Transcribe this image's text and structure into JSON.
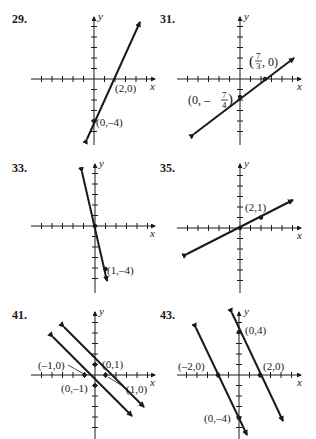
{
  "figure": {
    "panels": [
      {
        "number": "29.",
        "lines": [
          {
            "points": [
              [
                2,
                0
              ],
              [
                0,
                -4
              ]
            ],
            "labels": [
              "(2,0)",
              "(0,–4)"
            ]
          }
        ]
      },
      {
        "number": "31.",
        "lines": [
          {
            "points": [
              [
                2.333,
                0
              ],
              [
                0,
                -1.75
              ]
            ],
            "labels": [
              "(7/3, 0)",
              "(0, –7/4)"
            ]
          }
        ]
      },
      {
        "number": "33.",
        "lines": [
          {
            "points": [
              [
                0,
                0
              ],
              [
                1,
                -4
              ]
            ],
            "labels": [
              "(1,–4)"
            ]
          }
        ]
      },
      {
        "number": "35.",
        "lines": [
          {
            "points": [
              [
                0,
                0
              ],
              [
                2,
                1
              ]
            ],
            "labels": [
              "(2,1)"
            ]
          }
        ]
      },
      {
        "number": "41.",
        "lines": [
          {
            "points": [
              [
                -1,
                0
              ],
              [
                0,
                -1
              ]
            ],
            "labels": [
              "(–1,0)",
              "(0,–1)"
            ]
          },
          {
            "points": [
              [
                1,
                0
              ],
              [
                0,
                1
              ]
            ],
            "labels": [
              "(1,0)",
              "(0,1)"
            ]
          }
        ]
      },
      {
        "number": "43.",
        "lines": [
          {
            "points": [
              [
                -2,
                0
              ],
              [
                0,
                -4
              ]
            ],
            "labels": [
              "(–2,0)",
              "(0,–4)"
            ]
          },
          {
            "points": [
              [
                2,
                0
              ],
              [
                0,
                4
              ]
            ],
            "labels": [
              "(2,0)",
              "(0,4)"
            ]
          }
        ]
      }
    ],
    "axis_labels": {
      "x": "x",
      "y": "y"
    },
    "label_text": {
      "p29_a": "(2,0)",
      "p29_b": "(0,–4)",
      "p31_a_num": "7",
      "p31_a_den": "3",
      "p31_a_pre": "(",
      "p31_a_post": ", 0)",
      "p31_b_pre": "(0, –",
      "p31_b_num": "7",
      "p31_b_den": "4",
      "p31_b_post": ")",
      "p33_a": "(1,–4)",
      "p35_a": "(2,1)",
      "p41_a": "(–1,0)",
      "p41_b": "(0,1)",
      "p41_c": "(0,–1)",
      "p41_d": "(1,0)",
      "p43_a": "(0,4)",
      "p43_b": "(–2,0)",
      "p43_c": "(2,0)",
      "p43_d": "(0,–4)"
    }
  }
}
